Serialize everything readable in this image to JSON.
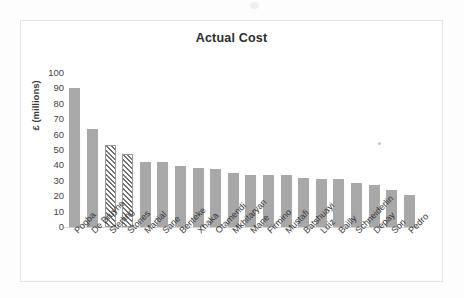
{
  "chart_data": {
    "type": "bar",
    "title": "Actual Cost",
    "xlabel": "",
    "ylabel": "£ (millions)",
    "ylim": [
      0,
      100
    ],
    "ytick_values": [
      100,
      90,
      80,
      70,
      60,
      50,
      40,
      30,
      20,
      10,
      0
    ],
    "ytick_labels": [
      "100",
      "90",
      "80",
      "70",
      "60",
      "50",
      "40",
      "30",
      "20",
      "10",
      "0"
    ],
    "grid": false,
    "legend": null,
    "categories": [
      "Pogba",
      "De Bruyne",
      "Sterling",
      "Stones",
      "Martial",
      "Sane",
      "Benteke",
      "Xhaka",
      "Otamendi",
      "Mkhitaryan",
      "Mane",
      "Firmino",
      "Mustafi",
      "Batshuayi",
      "Luiz",
      "Bailly",
      "Schneiderlin",
      "Depay",
      "Son",
      "Pedro"
    ],
    "values": [
      90,
      63.5,
      53.5,
      47.5,
      42.5,
      42.5,
      39.5,
      38,
      37.5,
      35,
      34,
      34,
      33.5,
      32,
      31.5,
      31,
      28.5,
      27.5,
      24,
      21
    ],
    "bar_styles": [
      "solid",
      "solid",
      "hatched",
      "hatched",
      "solid",
      "solid",
      "solid",
      "solid",
      "solid",
      "solid",
      "solid",
      "solid",
      "solid",
      "solid",
      "solid",
      "solid",
      "solid",
      "solid",
      "solid",
      "solid"
    ],
    "colors": {
      "bar_fill": "#a8a8a8",
      "hatch_line": "#6e6e6e",
      "hatch_background": "#ffffff",
      "axis_line": "#d4d4d4",
      "frame_border": "#e2e2e2",
      "plot_background": "#ffffff",
      "text": "#333333"
    }
  }
}
